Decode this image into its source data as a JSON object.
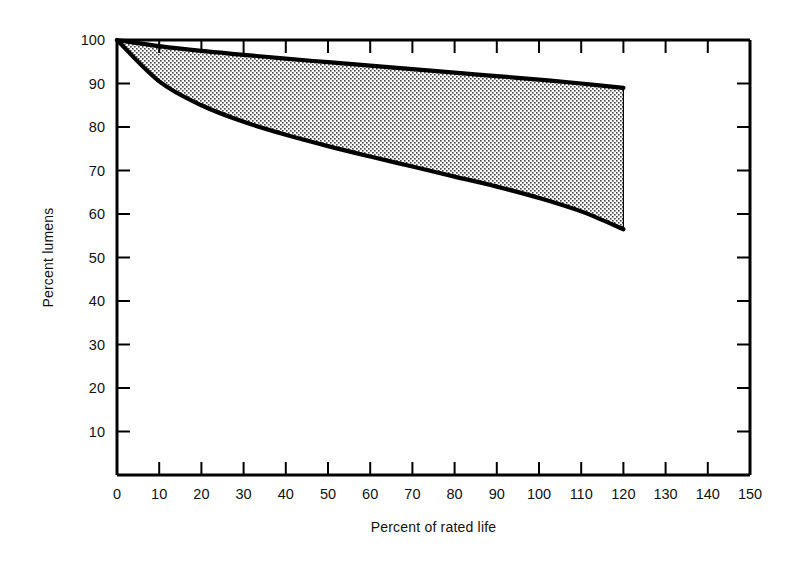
{
  "chart_data": {
    "type": "area",
    "title": "",
    "xlabel": "Percent of rated life",
    "ylabel": "Percent lumens",
    "xlim": [
      0,
      150
    ],
    "ylim": [
      0,
      100
    ],
    "xticks": [
      0,
      10,
      20,
      30,
      40,
      50,
      60,
      70,
      80,
      90,
      100,
      110,
      120,
      130,
      140,
      150
    ],
    "yticks": [
      10,
      20,
      30,
      40,
      50,
      60,
      70,
      80,
      90,
      100
    ],
    "xtick_labels": [
      "0",
      "10",
      "20",
      "30",
      "40",
      "50",
      "60",
      "70",
      "80",
      "90",
      "100",
      "110",
      "120",
      "130",
      "140",
      "150"
    ],
    "ytick_labels": [
      "10",
      "20",
      "30",
      "40",
      "50",
      "60",
      "70",
      "80",
      "90",
      "100"
    ],
    "grid": false,
    "legend": null,
    "fill_style": "stipple-halftone",
    "fill_color": "#d9d9d9",
    "line_color": "#000000",
    "band_end_x": 120,
    "x": [
      0,
      10,
      20,
      30,
      40,
      50,
      60,
      70,
      80,
      90,
      100,
      110,
      120
    ],
    "series": [
      {
        "name": "Upper limit",
        "values": [
          100.0,
          98.6,
          97.5,
          96.6,
          95.7,
          94.9,
          94.1,
          93.3,
          92.5,
          91.7,
          90.9,
          90.0,
          89.0
        ]
      },
      {
        "name": "Lower limit",
        "values": [
          100.0,
          90.5,
          85.0,
          81.2,
          78.2,
          75.6,
          73.2,
          70.9,
          68.6,
          66.3,
          63.7,
          60.6,
          56.5
        ]
      }
    ]
  },
  "axes": {
    "y_title": "Percent lumens",
    "x_title": "Percent of rated life"
  }
}
